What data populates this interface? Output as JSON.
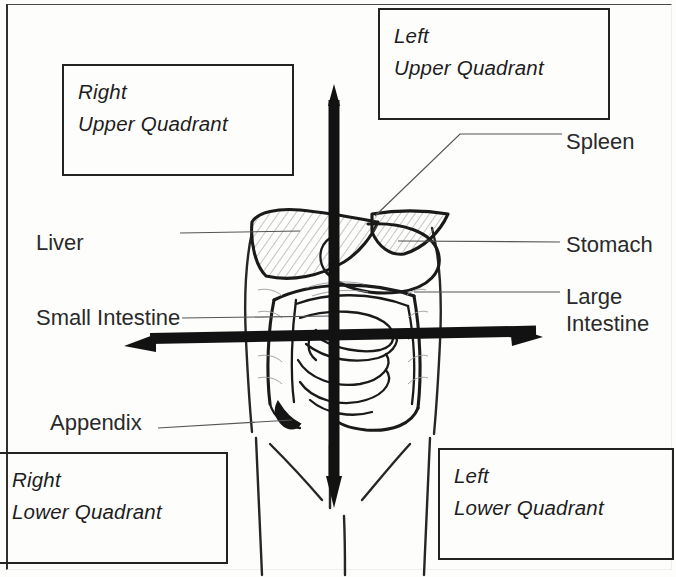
{
  "diagram": {
    "style": "hand-drawn line illustration, black ink on white"
  },
  "quadrant_boxes": [
    {
      "id": "right-upper-quadrant",
      "line1": "Right",
      "line2": "Upper Quadrant",
      "position": "top-left"
    },
    {
      "id": "left-upper-quadrant",
      "line1": "Left",
      "line2": "Upper Quadrant",
      "position": "top-right"
    },
    {
      "id": "right-lower-quadrant",
      "line1": "Right",
      "line2": "Lower Quadrant",
      "position": "bottom-left"
    },
    {
      "id": "left-lower-quadrant",
      "line1": "Left",
      "line2": "Lower Quadrant",
      "position": "bottom-right"
    }
  ],
  "organ_labels": {
    "liver": "Liver",
    "small_intestine": "Small Intestine",
    "appendix": "Appendix",
    "spleen": "Spleen",
    "stomach": "Stomach",
    "large_intestine_line1": "Large",
    "large_intestine_line2": "Intestine"
  },
  "axes": {
    "vertical": {
      "name": "midsagittal-axis",
      "orientation": "vertical",
      "arrowheads": "both"
    },
    "horizontal": {
      "name": "transumbilical-axis",
      "orientation": "horizontal",
      "arrowheads": "both"
    }
  },
  "colors": {
    "ink": "#1a1a1a",
    "text": "#2a2a2a",
    "box_border": "#232323",
    "leader_line": "#555555",
    "hatch": "#8c8c8c",
    "background": "#fdfdfc"
  }
}
